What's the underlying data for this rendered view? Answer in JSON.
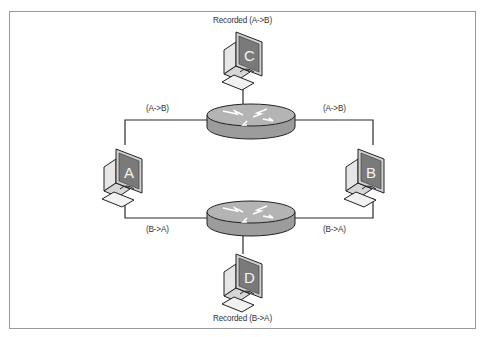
{
  "diagram": {
    "type": "network-topology",
    "colors": {
      "frame": "#9a9a9a",
      "link": "#2a2a2a",
      "router_body": "#9c9c9c",
      "router_top": "#b4b4b4",
      "monitor_screen": "#7a7a7a",
      "monitor_body": "#cfcfcf",
      "keyboard": "#f2f2f2"
    },
    "nodes": [
      {
        "id": "C",
        "kind": "computer",
        "label": "C",
        "caption": "Recorded (A->B)"
      },
      {
        "id": "A",
        "kind": "computer",
        "label": "A"
      },
      {
        "id": "B",
        "kind": "computer",
        "label": "B"
      },
      {
        "id": "D",
        "kind": "computer",
        "label": "D",
        "caption": "Recorded (B->A)"
      },
      {
        "id": "R1",
        "kind": "router",
        "label": ""
      },
      {
        "id": "R2",
        "kind": "router",
        "label": ""
      }
    ],
    "edges": [
      {
        "from": "A",
        "to": "R1",
        "label": "(A->B)"
      },
      {
        "from": "R1",
        "to": "B",
        "label": "(A->B)"
      },
      {
        "from": "C",
        "to": "R1",
        "label": ""
      },
      {
        "from": "B",
        "to": "R2",
        "label": "(B->A)"
      },
      {
        "from": "R2",
        "to": "A",
        "label": "(B->A)"
      },
      {
        "from": "R2",
        "to": "D",
        "label": ""
      }
    ],
    "labels": {
      "top_left_link": "(A->B)",
      "top_right_link": "(A->B)",
      "bottom_left_link": "(B->A)",
      "bottom_right_link": "(B->A)",
      "caption_c": "Recorded (A->B)",
      "caption_d": "Recorded (B->A)",
      "node_a": "A",
      "node_b": "B",
      "node_c": "C",
      "node_d": "D"
    }
  }
}
